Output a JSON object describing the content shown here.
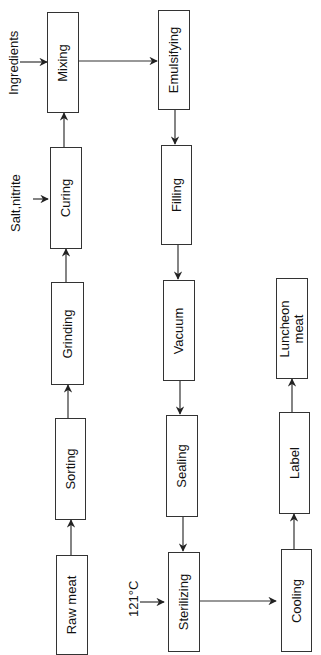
{
  "diagram": {
    "type": "process-flowchart",
    "orientation": "rotated-90-ccw",
    "steps": [
      {
        "id": "raw_meat",
        "label": "Raw meat"
      },
      {
        "id": "sorting",
        "label": "Sorting"
      },
      {
        "id": "grinding",
        "label": "Grinding"
      },
      {
        "id": "curing",
        "label": "Curing"
      },
      {
        "id": "mixing",
        "label": "Mixing"
      },
      {
        "id": "emulsifying",
        "label": "Emulsifying"
      },
      {
        "id": "filling",
        "label": "Filling"
      },
      {
        "id": "vacuum",
        "label": "Vacuum"
      },
      {
        "id": "sealing",
        "label": "Sealing"
      },
      {
        "id": "sterilizing",
        "label": "Sterilizing"
      },
      {
        "id": "cooling",
        "label": "Cooling"
      },
      {
        "id": "label",
        "label": "Label"
      },
      {
        "id": "luncheon_meat",
        "label": "Luncheon meat"
      }
    ],
    "inputs": [
      {
        "to": "curing",
        "label": "Salt,nitrite"
      },
      {
        "to": "mixing",
        "label": "Ingredients"
      },
      {
        "to": "sterilizing",
        "label": "121°C"
      }
    ],
    "edges": [
      [
        "raw_meat",
        "sorting"
      ],
      [
        "sorting",
        "grinding"
      ],
      [
        "grinding",
        "curing"
      ],
      [
        "curing",
        "mixing"
      ],
      [
        "mixing",
        "emulsifying"
      ],
      [
        "emulsifying",
        "filling"
      ],
      [
        "filling",
        "vacuum"
      ],
      [
        "vacuum",
        "sealing"
      ],
      [
        "sealing",
        "sterilizing"
      ],
      [
        "sterilizing",
        "cooling"
      ],
      [
        "cooling",
        "label"
      ],
      [
        "label",
        "luncheon_meat"
      ]
    ],
    "colors": {
      "line": "#333333",
      "text": "#111111",
      "background": "#ffffff"
    }
  }
}
